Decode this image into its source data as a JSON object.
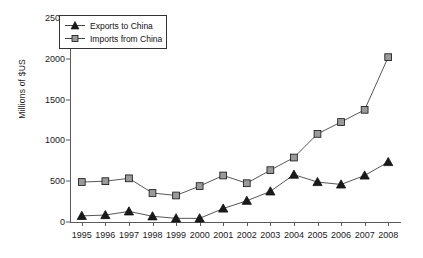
{
  "chart_data": {
    "type": "line",
    "title": "",
    "xlabel": "",
    "ylabel": "Millions of $US",
    "categories": [
      "1995",
      "1996",
      "1997",
      "1998",
      "1999",
      "2000",
      "2001",
      "2002",
      "2003",
      "2004",
      "2005",
      "2006",
      "2007",
      "2008"
    ],
    "x": [
      1995,
      1996,
      1997,
      1998,
      1999,
      2000,
      2001,
      2002,
      2003,
      2004,
      2005,
      2006,
      2007,
      2008
    ],
    "ylim": [
      0,
      2500
    ],
    "yticks": [
      0,
      500,
      1000,
      1500,
      2000,
      2500
    ],
    "ytick_labels": [
      "0",
      "500",
      "1000",
      "1500",
      "2000",
      "2500"
    ],
    "grid": false,
    "legend_position": "top-left",
    "series": [
      {
        "name": "Exports to China",
        "marker": "triangle",
        "marker_fill": "#1a1a1a",
        "line_color": "#444444",
        "values": [
          75,
          85,
          130,
          70,
          45,
          45,
          165,
          260,
          375,
          580,
          490,
          460,
          570,
          735
        ]
      },
      {
        "name": "Imports from China",
        "marker": "square",
        "marker_fill": "#9a9a9a",
        "line_color": "#444444",
        "values": [
          490,
          500,
          535,
          355,
          325,
          440,
          570,
          475,
          635,
          790,
          1080,
          1225,
          1375,
          2020
        ]
      }
    ]
  },
  "legend": {
    "items": [
      {
        "label": "Exports to China",
        "marker": "triangle-marker"
      },
      {
        "label": "Imports from China",
        "marker": "square-marker"
      }
    ]
  },
  "axes": {
    "y_axis_title": "Millions of $US"
  },
  "colors": {
    "axis": "#5a5a5a",
    "text": "#1a1a1a",
    "exports_marker": "#1a1a1a",
    "imports_marker": "#9a9a9a",
    "line": "#444444",
    "background": "#ffffff"
  }
}
